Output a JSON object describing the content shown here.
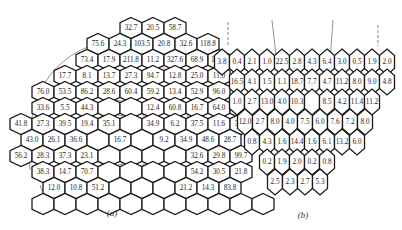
{
  "figure_a": {
    "caption": "(a)",
    "rows": [
      {
        "y": 28,
        "x0": 131,
        "values": [
          "32.7",
          "20.5",
          "58.7"
        ]
      },
      {
        "y": 44,
        "x0": 98,
        "values": [
          "75.6",
          "24.3",
          "103.5",
          "20.8",
          "32.6",
          "118.8"
        ]
      },
      {
        "y": 60,
        "x0": 87,
        "values": [
          "73.4",
          "17.9",
          "211.8",
          "11.2",
          "327.6",
          "68.9",
          "123.3"
        ]
      },
      {
        "y": 76,
        "x0": 65,
        "values": [
          "17.7",
          "8.1",
          "13.7",
          "27.3",
          "94.7",
          "12.8",
          "25.0",
          "11.0"
        ]
      },
      {
        "y": 92,
        "x0": 43,
        "values": [
          "76.0",
          "53.5",
          "86.2",
          "28.6",
          "60.4",
          "59.2",
          "13.4",
          "52.9",
          "96.0"
        ]
      },
      {
        "y": 108,
        "x0": 43,
        "values": [
          "33.6",
          "5.5",
          "44.3",
          "",
          "",
          "12.4",
          "60.8",
          "16.7",
          "64.0",
          "5.5"
        ]
      },
      {
        "y": 124,
        "x0": 21,
        "values": [
          "41.8",
          "27.3",
          "39.5",
          "19.4",
          "35.1",
          "",
          "34.9",
          "6.2",
          "37.5",
          "11.6",
          "31.2"
        ]
      },
      {
        "y": 140,
        "x0": 32,
        "values": [
          "43.0",
          "26.1",
          "36.6",
          "",
          "16.7",
          "",
          "9.2",
          "34.9",
          "48.6",
          "28.7"
        ]
      },
      {
        "y": 156,
        "x0": 21,
        "values": [
          "56.2",
          "28.3",
          "37.3",
          "23.1",
          "",
          "",
          "",
          "",
          "32.6",
          "29.8",
          "99.7"
        ]
      },
      {
        "y": 172,
        "x0": 43,
        "values": [
          "38.3",
          "14.7",
          "70.7",
          "",
          "",
          "",
          "",
          "54.2",
          "30.5",
          "21.8"
        ]
      },
      {
        "y": 188,
        "x0": 54,
        "values": [
          "12.0",
          "10.8",
          "51.2",
          "",
          "",
          "",
          "21.2",
          "14.3",
          "83.8"
        ]
      },
      {
        "y": 204,
        "x0": 43,
        "values": [
          "",
          "",
          "",
          "",
          "",
          "",
          "",
          "",
          "",
          "",
          ""
        ]
      }
    ]
  },
  "figure_b": {
    "caption": "(b)",
    "rows": [
      {
        "y": 62,
        "x0": 222,
        "values": [
          "3.8",
          "0.4",
          "2.1",
          "1.0",
          "22.5",
          "2.8",
          "4.3",
          "6.4",
          "3.0",
          "0.5",
          "1.9",
          "2.0"
        ]
      },
      {
        "y": 82,
        "x0": 237,
        "values": [
          "16.5",
          "4.1",
          "1.5",
          "1.1",
          "18.7",
          "7.7",
          "4.7",
          "11.2",
          "8.0",
          "9.0",
          "4.8"
        ]
      },
      {
        "y": 102,
        "x0": 237,
        "values": [
          "1.0",
          "2.7",
          "13.0",
          "4.0",
          "10.3",
          "",
          "8.5",
          "4.2",
          "11.4",
          "11.2"
        ]
      },
      {
        "y": 122,
        "x0": 245,
        "values": [
          "12.0",
          "2.7",
          "8.0",
          "4.0",
          "7.5",
          "6.0",
          "7.6",
          "7.2",
          "8.0"
        ]
      },
      {
        "y": 142,
        "x0": 252,
        "values": [
          "0.8",
          "4.3",
          "1.6",
          "14.4",
          "1.6",
          "6.1",
          "13.2",
          "6.0"
        ]
      },
      {
        "y": 162,
        "x0": 267,
        "values": [
          "0.2",
          "1.9",
          "2.0",
          "0.2",
          "0.8"
        ]
      },
      {
        "y": 182,
        "x0": 275,
        "values": [
          "2.5",
          "2.3",
          "2.7",
          "5.3"
        ]
      }
    ]
  }
}
